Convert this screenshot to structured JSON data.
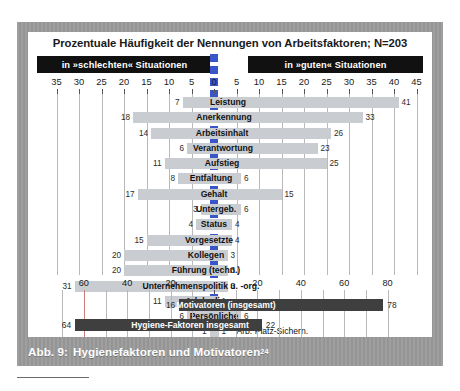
{
  "figure": {
    "title": "Prozentuale Häufigkeit der Nennungen von Arbeitsfaktoren; N=203",
    "header_left": "in »schlechten« Situationen",
    "header_right": "in »guten« Situationen",
    "caption_prefix": "Abb. 9:",
    "caption_text": "Hygienefaktoren und Motivatoren",
    "caption_superscript": "24"
  },
  "colors": {
    "mount": "#9a9a9a",
    "panel": "#ffffff",
    "header_band": "#111111",
    "zero_marker": "#3a55c8",
    "bar_light": "#c9ccd1",
    "bar_dark": "#3f3f3f",
    "gridline": "#b9b9b9",
    "gridline_red": "#c98080"
  },
  "chart_data": {
    "type": "bar",
    "title": "Prozentuale Häufigkeit der Nennungen von Arbeitsfaktoren; N=203",
    "subtitle": "",
    "xlabel": "",
    "ylabel": "",
    "orientation": "horizontal-diverging",
    "grid": true,
    "legend_position": "top-bands",
    "legend": [
      "in »schlechten« Situationen",
      "in »guten« Situationen"
    ],
    "axis_top": {
      "left_ticks": [
        35,
        30,
        25,
        20,
        15,
        10,
        5
      ],
      "zero": 0,
      "right_ticks": [
        5,
        10,
        15,
        20,
        25,
        30,
        35,
        40,
        45
      ],
      "xlim": [
        -35,
        45
      ]
    },
    "axis_bottom": {
      "left_ticks": [
        60,
        40,
        20
      ],
      "zero": 0,
      "right_ticks": [
        20,
        40,
        60,
        80
      ],
      "xlim": [
        -70,
        85
      ]
    },
    "categories": [
      "Leistung",
      "Anerkennung",
      "Arbeitsinhalt",
      "Verantwortung",
      "Aufstieg",
      "Entfaltung",
      "Gehalt",
      "Untergeb.",
      "Status",
      "Vorgesetzte",
      "Kollegen",
      "Führung (techn.)",
      "Unternehmenspolitik u. -org.",
      "Arb.beding.",
      "Persönliche",
      "Arb. Platz-Sichern."
    ],
    "series": [
      {
        "name": "in »schlechten« Situationen",
        "values": [
          7,
          18,
          14,
          6,
          11,
          8,
          17,
          3,
          4,
          15,
          20,
          20,
          31,
          11,
          6,
          1
        ]
      },
      {
        "name": "in »guten« Situationen",
        "values": [
          41,
          33,
          26,
          23,
          25,
          6,
          15,
          6,
          4,
          4,
          3,
          3,
          3,
          1,
          6,
          1
        ]
      }
    ],
    "summary": {
      "categories": [
        "Motivatoren (insgesamt)",
        "Hygiene-Faktoren insgesamt"
      ],
      "series": [
        {
          "name": "in »schlechten« Situationen",
          "values": [
            16,
            64
          ]
        },
        {
          "name": "in »guten« Situationen",
          "values": [
            78,
            22
          ]
        }
      ]
    }
  },
  "rows": [
    {
      "label": "Leistung",
      "left": 7,
      "right": 41,
      "label_inside": true,
      "label_offset": 14
    },
    {
      "label": "Anerkennung",
      "left": 18,
      "right": 33,
      "label_inside": true,
      "label_offset": 10
    },
    {
      "label": "Arbeitsinhalt",
      "left": 14,
      "right": 26,
      "label_inside": true,
      "label_offset": 8
    },
    {
      "label": "Verantwortung",
      "left": 6,
      "right": 23,
      "label_inside": true,
      "label_offset": 9
    },
    {
      "label": "Aufstieg",
      "left": 11,
      "right": 25,
      "label_inside": true,
      "label_offset": 8
    },
    {
      "label": "Entfaltung",
      "left": 8,
      "right": 6,
      "label_inside": true,
      "label_offset": -3
    },
    {
      "label": "Gehalt",
      "left": 17,
      "right": 15,
      "label_inside": true,
      "label_offset": 0
    },
    {
      "label": "Untergeb.",
      "left": 3,
      "right": 6,
      "label_inside": true,
      "label_offset": 2
    },
    {
      "label": "Status",
      "left": 4,
      "right": 4,
      "label_inside": true,
      "label_offset": 0
    },
    {
      "label": "Vorgesetzte",
      "left": 15,
      "right": 4,
      "label_inside": true,
      "label_offset": -5
    },
    {
      "label": "Kollegen",
      "left": 20,
      "right": 3,
      "label_inside": true,
      "label_offset": -8
    },
    {
      "label": "Führung (techn.)",
      "left": 20,
      "right": 3,
      "label_inside": true,
      "label_offset": -8
    },
    {
      "label": "Unternehmenspolitik u. -org.",
      "left": 31,
      "right": 3,
      "label_inside": true,
      "label_offset": -13
    },
    {
      "label": "Arb.beding.",
      "left": 11,
      "right": 1,
      "label_inside": true,
      "label_offset": -5
    },
    {
      "label": "Persönliche",
      "left": 6,
      "right": 6,
      "label_inside": true,
      "label_offset": 0
    },
    {
      "label": "Arb. Platz-Sichern.",
      "left": 1,
      "right": 1,
      "label_inside": false,
      "label_offset": 0
    }
  ],
  "summary_rows": [
    {
      "label": "Motivatoren (insgesamt)",
      "left": 16,
      "right": 78,
      "label_offset": 12
    },
    {
      "label": "Hygiene-Faktoren insgesamt",
      "left": 64,
      "right": 22,
      "label_offset": -24
    }
  ]
}
